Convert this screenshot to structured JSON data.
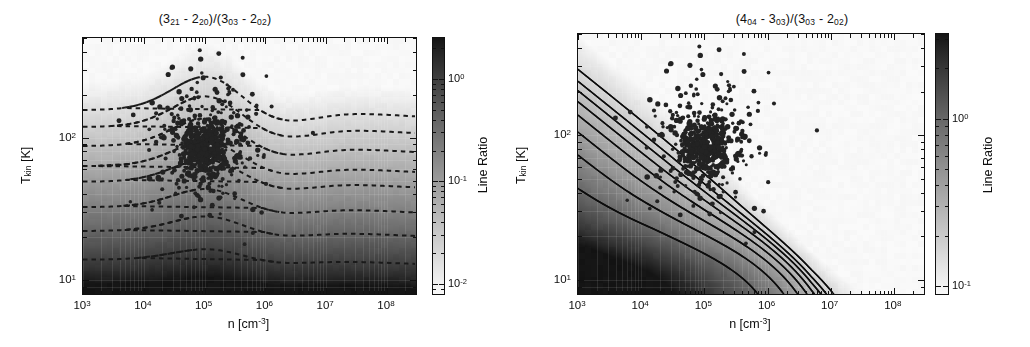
{
  "figure": {
    "width": 1030,
    "height": 347,
    "background": "#ffffff",
    "panel_count": 2
  },
  "axes": {
    "xlabel_text": "n [cm",
    "xlabel_sup": "-3",
    "xlabel_tail": "]",
    "ylabel_main": "T",
    "ylabel_sub": "kin",
    "ylabel_tail": " [K]",
    "x_ticks": [
      {
        "label": "10",
        "exp": "3",
        "value": 1000
      },
      {
        "label": "10",
        "exp": "4",
        "value": 10000
      },
      {
        "label": "10",
        "exp": "5",
        "value": 100000
      },
      {
        "label": "10",
        "exp": "6",
        "value": 1000000
      },
      {
        "label": "10",
        "exp": "7",
        "value": 10000000
      },
      {
        "label": "10",
        "exp": "8",
        "value": 100000000
      }
    ],
    "y_ticks": [
      {
        "label": "10",
        "exp": "1",
        "value": 10
      },
      {
        "label": "10",
        "exp": "2",
        "value": 100
      }
    ],
    "xscale": "log",
    "yscale": "log",
    "xlim": [
      1000,
      300000000
    ],
    "ylim": [
      8,
      500
    ]
  },
  "colorbar": {
    "title": "Line Ratio",
    "left_labels": [
      {
        "label": "10",
        "exp": "0",
        "value": 1
      },
      {
        "label": "10",
        "exp": "-1",
        "value": 0.1
      },
      {
        "label": "10",
        "exp": "-2",
        "value": 0.01
      }
    ],
    "right_labels": [
      {
        "label": "10",
        "exp": "0",
        "value": 1
      },
      {
        "label": "10",
        "exp": "-1",
        "value": 0.1
      }
    ],
    "left_range": [
      0.008,
      2.5
    ],
    "right_range": [
      0.09,
      3.2
    ],
    "colormap": "grayscale"
  },
  "panels": [
    {
      "id": "left",
      "title_parts": [
        {
          "base": "(3",
          "sub": "21"
        },
        {
          "base": " - 2",
          "sub": "20"
        },
        {
          "base": ")/(3",
          "sub": "03"
        },
        {
          "base": " - 2",
          "sub": "02"
        },
        {
          "base": ")",
          "sub": ""
        }
      ],
      "title_plain": "(3_21 - 2_20)/(3_03 - 2_02)",
      "contour_style": "dashed",
      "contour_color": "#1a1a1a",
      "scatter_color": "#232323",
      "scatter_count": 640
    },
    {
      "id": "right",
      "title_parts": [
        {
          "base": "(4",
          "sub": "04"
        },
        {
          "base": " - 3",
          "sub": "03"
        },
        {
          "base": ")/(3",
          "sub": "03"
        },
        {
          "base": " - 2",
          "sub": "02"
        },
        {
          "base": ")",
          "sub": ""
        }
      ],
      "title_plain": "(4_04 - 3_03)/(3_03 - 2_02)",
      "contour_style": "solid",
      "contour_color": "#0c0c0c",
      "scatter_color": "#232323",
      "scatter_count": 620
    }
  ],
  "chart_data": [
    {
      "type": "heatmap",
      "panel": "left",
      "title": "(3_21 - 2_20)/(3_03 - 2_02)",
      "xlabel": "n [cm^-3]",
      "ylabel": "T_kin [K]",
      "cbar_label": "Line Ratio",
      "xscale": "log",
      "yscale": "log",
      "xlim": [
        1000,
        300000000
      ],
      "ylim": [
        8,
        500
      ],
      "clim": [
        0.008,
        2.5
      ],
      "cscale": "log",
      "colormap": "gray",
      "grid": false,
      "contours": {
        "style": "dashed",
        "levels": [
          0.02,
          0.05,
          0.1,
          0.2,
          0.3,
          0.5,
          0.8,
          1.2
        ],
        "description": "Quasi-horizontal wavy iso-ratio curves; value increases upward with T_kin; a broad dip near n~1e5 and a local bump near n~1e6."
      },
      "scatter": {
        "n_points": 640,
        "center_n": 100000,
        "center_T": 85,
        "spread_dex_n": 0.45,
        "spread_dex_T": 0.22,
        "description": "Dense observational cloud of sources centered near n ~ 1e5 cm^-3, T_kin ~ 80-100 K."
      },
      "field_description": "Line ratio rises steeply with T_kin from ~0.01 at 10 K to >1 above ~200 K; only weak dependence on density across 1e3-1e8 cm^-3."
    },
    {
      "type": "heatmap",
      "panel": "right",
      "title": "(4_04 - 3_03)/(3_03 - 2_02)",
      "xlabel": "n [cm^-3]",
      "ylabel": "T_kin [K]",
      "cbar_label": "Line Ratio",
      "xscale": "log",
      "yscale": "log",
      "xlim": [
        1000,
        300000000
      ],
      "ylim": [
        8,
        500
      ],
      "clim": [
        0.09,
        3.2
      ],
      "cscale": "log",
      "colormap": "gray",
      "grid": false,
      "contours": {
        "style": "solid",
        "levels": [
          0.3,
          0.5,
          0.7,
          0.9,
          1.1,
          1.3,
          1.5,
          1.8
        ],
        "description": "L-shaped (hyperbolic) iso-ratio curves: steep at low density, turning horizontal at high density; the bright ridge runs diagonally from upper-left to lower-right."
      },
      "scatter": {
        "n_points": 620,
        "center_n": 100000,
        "center_T": 85,
        "spread_dex_n": 0.45,
        "spread_dex_T": 0.22,
        "description": "Same observational cloud of sources centered near n ~ 1e5 cm^-3, T_kin ~ 80-100 K."
      },
      "field_description": "Ratio peaks along a bright diagonal band, then falls again at the highest densities and temperatures (dark upper-right corner)."
    }
  ]
}
